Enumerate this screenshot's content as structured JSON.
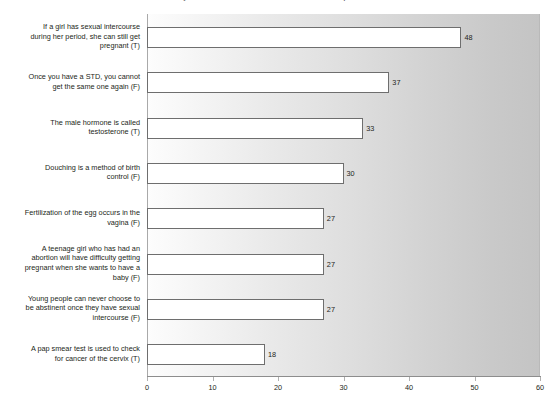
{
  "chart_data": {
    "type": "bar",
    "orientation": "horizontal",
    "title": "What they do if unsure about what is true about sexual and reproductive health",
    "xlabel": "",
    "ylabel": "",
    "xlim": [
      0,
      60
    ],
    "xticks": [
      0,
      10,
      20,
      30,
      40,
      50,
      60
    ],
    "grid": false,
    "legend": null,
    "bar_fill_color": "#ffffff",
    "bar_border_color": "#6e6e6e",
    "plot_background": "gradient light-grey left to darker grey right",
    "categories": [
      "If a girl has sexual intercourse during her period, she can still get pregnant (T)",
      "Once you have a STD, you cannot get the same one again (F)",
      "The male hormone is called testosterone (T)",
      "Douching is a method of birth control (F)",
      "Fertilization of the egg occurs in the vagina (F)",
      "A teenage girl who has had an abortion will have difficulty getting pregnant when she wants to have a baby (F)",
      "Young people can never choose to be abstinent once they have sexual intercourse (F)",
      "A pap smear test is used to check for cancer of the cervix (T)"
    ],
    "category_labels_wrapped": [
      "If a girl has sexual intercourse\nduring her period, she can still get\npregnant (T)",
      "Once you have a STD, you cannot\nget the same one again (F)",
      "The male hormone is called\ntestosterone (T)",
      "Douching is a method of birth\ncontrol (F)",
      "Fertilization of the egg occurs in the\nvagina (F)",
      "A teenage girl who has had an\nabortion will have difficulty getting\npregnant when she wants to have a\nbaby (F)",
      "Young people can never choose to\nbe abstinent once they have sexual\nintercourse (F)",
      "A pap smear test is used to check\nfor cancer of the cervix (T)"
    ],
    "values": [
      48,
      37,
      33,
      30,
      27,
      27,
      27,
      18
    ],
    "value_labels": [
      "48",
      "37",
      "33",
      "30",
      "27",
      "27",
      "27",
      "18"
    ]
  }
}
